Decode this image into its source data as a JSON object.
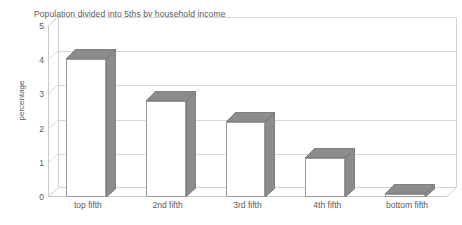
{
  "chart_data": {
    "type": "bar",
    "title": "Population divided into 5ths by household income",
    "xlabel": "",
    "ylabel": "percentage",
    "categories": [
      "top fifth",
      "2nd fifth",
      "3rd fifth",
      "4th fifth",
      "bottom fifth"
    ],
    "values": [
      4.05,
      2.8,
      2.2,
      1.15,
      0.1
    ],
    "ylim": [
      0,
      5
    ],
    "yticks": [
      0,
      1,
      2,
      3,
      4,
      5
    ],
    "ytick_labels": [
      "0",
      "1",
      "2",
      "3",
      "4",
      "5"
    ],
    "grid": "horizontal",
    "legend": "none",
    "style": "3d-bar",
    "bar_face_color": "#ffffff",
    "bar_shade_color": "#8c8c8c",
    "bar_outline_color": "#9b9b9b",
    "grid_color": "#d8d8d8",
    "text_color": "#5a5a5a"
  }
}
